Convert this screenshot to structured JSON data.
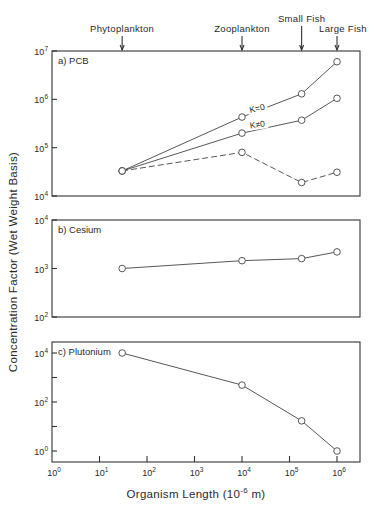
{
  "chart_data": [
    {
      "id": "a",
      "type": "line",
      "title": "a) PCB",
      "panel_label": "a) PCB",
      "xscale": "log",
      "yscale": "log",
      "xlim": [
        1,
        2500000
      ],
      "ylim": [
        10000,
        10000000
      ],
      "yticks": [
        10000,
        100000,
        1000000,
        10000000
      ],
      "ytick_labels": [
        {
          "base": "10",
          "exp": "4"
        },
        {
          "base": "10",
          "exp": "5"
        },
        {
          "base": "10",
          "exp": "6"
        },
        {
          "base": "10",
          "exp": "7"
        }
      ],
      "x": [
        30,
        10000,
        180000,
        1000000
      ],
      "series": [
        {
          "name": "K=0",
          "style": "solid",
          "values": [
            33000,
            430000,
            1300000,
            6000000
          ]
        },
        {
          "name": "K≠0",
          "style": "solid",
          "values": [
            33000,
            200000,
            370000,
            1050000
          ]
        },
        {
          "name": "observed",
          "style": "dashed",
          "values": [
            33000,
            80000,
            19000,
            31000
          ]
        }
      ],
      "annotations": [
        {
          "text": "K=0",
          "x": 15000,
          "y": 520000,
          "rotate": -14
        },
        {
          "text": "K≠0",
          "x": 15000,
          "y": 250000,
          "rotate": -8
        }
      ],
      "grid": false,
      "legend": null
    },
    {
      "id": "b",
      "type": "line",
      "title": "b) Cesium",
      "panel_label": "b) Cesium",
      "xscale": "log",
      "yscale": "log",
      "xlim": [
        1,
        2500000
      ],
      "ylim": [
        100,
        10000
      ],
      "yticks": [
        100,
        1000,
        10000
      ],
      "ytick_labels": [
        {
          "base": "10",
          "exp": "2"
        },
        {
          "base": "10",
          "exp": "3"
        },
        {
          "base": "10",
          "exp": "4"
        }
      ],
      "x": [
        30,
        10000,
        180000,
        1000000
      ],
      "series": [
        {
          "name": "Cesium",
          "style": "solid",
          "values": [
            1000,
            1450,
            1600,
            2200
          ]
        }
      ],
      "grid": false,
      "legend": null
    },
    {
      "id": "c",
      "type": "line",
      "title": "c) Plutonium",
      "panel_label": "c) Plutonium",
      "xscale": "log",
      "yscale": "log",
      "xlim": [
        1,
        2500000
      ],
      "ylim": [
        0.35,
        30000
      ],
      "yticks": [
        1,
        10,
        100,
        1000,
        10000
      ],
      "ytick_labels": [
        {
          "base": "10",
          "exp": "0"
        },
        null,
        {
          "base": "10",
          "exp": "2"
        },
        null,
        {
          "base": "10",
          "exp": "4"
        }
      ],
      "x": [
        30,
        10000,
        180000,
        1000000
      ],
      "series": [
        {
          "name": "Plutonium",
          "style": "solid",
          "values": [
            10000,
            490,
            17,
            1
          ]
        }
      ],
      "grid": false,
      "legend": null
    }
  ],
  "shared": {
    "xlabel": "Organism Length (10⁻⁶ m)",
    "xlabel_main": "Organism Length (10",
    "xlabel_exp": "-6",
    "xlabel_tail": " m)",
    "ylabel": "Concentration Factor (Wet Weight Basis)",
    "xticks": [
      1,
      10,
      100,
      1000,
      10000,
      100000,
      1000000
    ],
    "xtick_labels": [
      {
        "base": "10",
        "exp": "0"
      },
      {
        "base": "10",
        "exp": "1"
      },
      {
        "base": "10",
        "exp": "2"
      },
      {
        "base": "10",
        "exp": "3"
      },
      {
        "base": "10",
        "exp": "4"
      },
      {
        "base": "10",
        "exp": "5"
      },
      {
        "base": "10",
        "exp": "6"
      }
    ],
    "organisms": [
      {
        "label": "Phytoplankton",
        "x": 30
      },
      {
        "label": "Zooplankton",
        "x": 10000
      },
      {
        "label": "Small Fish",
        "x": 180000
      },
      {
        "label": "Large Fish",
        "x": 1000000
      }
    ],
    "colors": {
      "ink": "#333333",
      "background": "#ffffff",
      "marker_fill": "#ffffff"
    }
  }
}
